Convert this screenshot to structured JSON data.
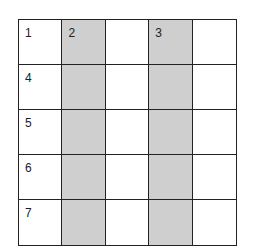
{
  "title": "",
  "grid": {
    "rows": 5,
    "cols": 5,
    "shaded_columns": [
      2,
      4
    ],
    "cells": [
      [
        "1",
        "2",
        "",
        "3",
        ""
      ],
      [
        "4",
        "",
        "",
        "",
        ""
      ],
      [
        "5",
        "",
        "",
        "",
        ""
      ],
      [
        "6",
        "",
        "",
        "",
        ""
      ],
      [
        "7",
        "",
        "",
        "",
        ""
      ]
    ],
    "colors": {
      "shade": "#cfcfcf",
      "line": "#222222",
      "background": "#ffffff"
    }
  }
}
